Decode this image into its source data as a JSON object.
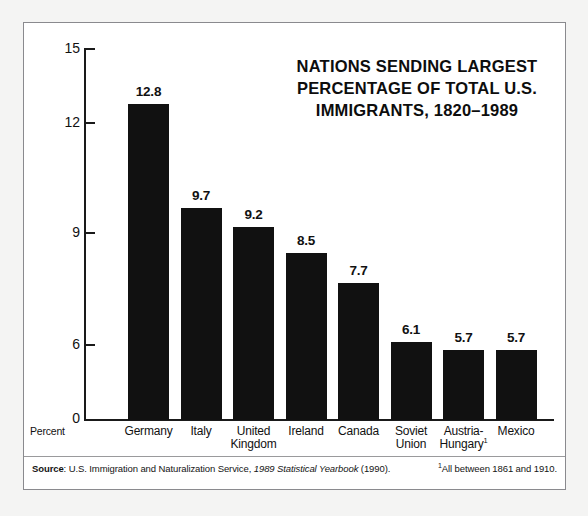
{
  "chart_data": {
    "type": "bar",
    "title_lines": [
      "NATIONS SENDING LARGEST",
      "PERCENTAGE OF TOTAL U.S.",
      "IMMIGRANTS, 1820–1989"
    ],
    "categories": [
      "Germany",
      "Italy",
      "United Kingdom",
      "Ireland",
      "Canada",
      "Soviet Union",
      "Austria-Hungary",
      "Mexico"
    ],
    "category_lines": [
      [
        "Germany"
      ],
      [
        "Italy"
      ],
      [
        "United",
        "Kingdom"
      ],
      [
        "Ireland"
      ],
      [
        "Canada"
      ],
      [
        "Soviet",
        "Union"
      ],
      [
        "Austria-",
        "Hungary"
      ],
      [
        "Mexico"
      ]
    ],
    "values": [
      12.8,
      9.7,
      9.2,
      8.5,
      7.7,
      6.1,
      5.7,
      5.7
    ],
    "value_labels": [
      "12.8",
      "9.7",
      "9.2",
      "8.5",
      "7.7",
      "6.1",
      "5.7",
      "5.7"
    ],
    "footnote_markers": [
      "",
      "",
      "",
      "",
      "",
      "",
      "1",
      ""
    ],
    "xlabel": "",
    "ylabel": "Percent",
    "ylim": [
      0,
      15
    ],
    "yticks": [
      15,
      12,
      9,
      6,
      0
    ],
    "ytick_labels": [
      "15",
      "12",
      "9",
      "6",
      "0"
    ],
    "grid": false,
    "legend": false,
    "bar_color": "#111111",
    "axis_color": "#1a1a1a",
    "background": "#ffffff"
  },
  "axis": {
    "percent_label": "Percent"
  },
  "footer": {
    "source_label": "Source",
    "source_sep": ": ",
    "source_agency": "U.S. Immigration and Naturalization Service, ",
    "source_publication": "1989 Statistical Yearbook",
    "source_year": " (1990).",
    "footnote_marker": "1",
    "footnote_text": "All between 1861 and 1910."
  }
}
